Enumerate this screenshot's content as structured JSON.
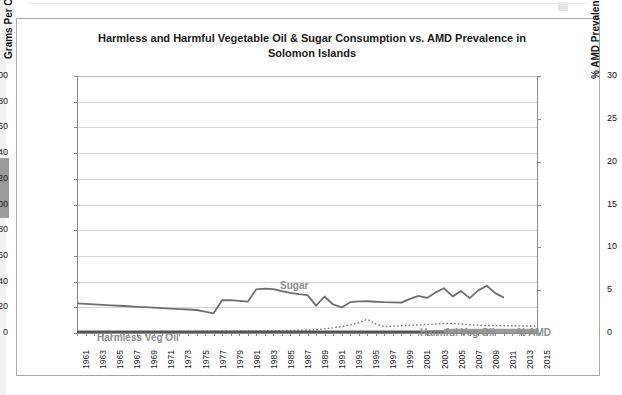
{
  "chart_data": {
    "type": "line",
    "title": "Harmless and Harmful Vegetable Oil & Sugar Consumption vs. AMD Prevalence in Solomon Islands",
    "title_line1": "Harmless and Harmful Vegetable Oil & Sugar Consumption vs. AMD Prevalence in",
    "title_line2": "Solomon Islands",
    "xlabel": "",
    "ylabel": "Grams Per Capita Per Day",
    "ylabel_secondary": "% AMD Prevalence",
    "ylim": [
      0,
      200
    ],
    "ylim_secondary": [
      0,
      30
    ],
    "yticks": [
      0,
      20,
      40,
      60,
      80,
      100,
      120,
      140,
      160,
      180,
      200
    ],
    "yticks_secondary": [
      0,
      5,
      10,
      15,
      20,
      25,
      30
    ],
    "grid": true,
    "legend_position": "inline-annotations",
    "x": [
      1961,
      1962,
      1963,
      1964,
      1965,
      1966,
      1967,
      1968,
      1969,
      1970,
      1971,
      1972,
      1973,
      1974,
      1975,
      1976,
      1977,
      1978,
      1979,
      1980,
      1981,
      1982,
      1983,
      1984,
      1985,
      1986,
      1987,
      1988,
      1989,
      1990,
      1991,
      1992,
      1993,
      1994,
      1995,
      1996,
      1997,
      1998,
      1999,
      2000,
      2001,
      2002,
      2003,
      2004,
      2005,
      2006,
      2007,
      2008,
      2009,
      2010,
      2011,
      2012,
      2013,
      2014,
      2015
    ],
    "xticks": [
      1961,
      1963,
      1965,
      1967,
      1969,
      1971,
      1973,
      1975,
      1977,
      1979,
      1981,
      1983,
      1985,
      1987,
      1989,
      1991,
      1993,
      1995,
      1997,
      1999,
      2001,
      2003,
      2005,
      2007,
      2009,
      2011,
      2013,
      2015
    ],
    "series": [
      {
        "name": "Sugar",
        "axis": "left",
        "color": "#6f6f6f",
        "style": "solid",
        "width": 1.8,
        "values": [
          23,
          22.6,
          22.2,
          21.9,
          21.5,
          21.2,
          20.8,
          20.4,
          20.1,
          19.7,
          19.4,
          19,
          18.6,
          18.3,
          17.9,
          16.6,
          15.3,
          25.5,
          25.6,
          25,
          24.4,
          34,
          34.5,
          34.2,
          32.6,
          31.3,
          30.2,
          29.5,
          21.3,
          28.4,
          22.2,
          19.9,
          24,
          24.6,
          24.7,
          24.3,
          24,
          23.9,
          23.6,
          26.6,
          28.9,
          27.3,
          31.6,
          34.8,
          28.5,
          32.6,
          27.1,
          33.2,
          36.8,
          31,
          27.5,
          null,
          null,
          null,
          null
        ]
      },
      {
        "name": "% AMD",
        "axis": "right",
        "color": "#7a7a7a",
        "style": "dotted",
        "width": 1.4,
        "values": [
          0.12,
          0.12,
          0.13,
          0.13,
          0.14,
          0.14,
          0.15,
          0.15,
          0.16,
          0.16,
          0.17,
          0.17,
          0.18,
          0.18,
          0.19,
          0.2,
          0.2,
          0.21,
          0.22,
          0.23,
          0.24,
          0.25,
          0.26,
          0.27,
          0.28,
          0.3,
          0.32,
          0.35,
          0.4,
          0.48,
          0.6,
          0.75,
          0.95,
          1.2,
          1.6,
          1.05,
          0.75,
          0.8,
          0.85,
          0.9,
          0.95,
          1,
          1.05,
          1.1,
          1.12,
          1.05,
          0.95,
          0.9,
          0.88,
          0.86,
          0.85,
          0.84,
          0.83,
          0.82,
          0.8
        ]
      },
      {
        "name": "Harmless Veg Oil",
        "axis": "left",
        "color": "#555555",
        "style": "solid",
        "width": 3.0,
        "values": [
          0.7,
          0.7,
          0.7,
          0.7,
          0.7,
          0.7,
          0.7,
          0.7,
          0.7,
          0.7,
          0.7,
          0.7,
          0.7,
          0.7,
          0.7,
          0.7,
          0.7,
          0.7,
          0.7,
          0.7,
          0.7,
          0.7,
          0.7,
          0.7,
          0.7,
          0.7,
          0.7,
          0.7,
          0.7,
          0.7,
          0.7,
          0.7,
          0.7,
          0.7,
          0.7,
          0.7,
          0.7,
          0.7,
          0.7,
          0.7,
          0.7,
          0.7,
          0.7,
          0.7,
          0.7,
          0.7,
          0.7,
          0.7,
          0.7,
          0.7,
          0.7,
          0.7,
          0.7,
          0.7,
          0.7
        ]
      },
      {
        "name": "Harmful Veg Oil",
        "axis": "left",
        "color": "#9a9a9a",
        "style": "solid",
        "width": 7.0,
        "values": [
          null,
          null,
          null,
          null,
          null,
          null,
          null,
          null,
          null,
          null,
          null,
          null,
          null,
          null,
          null,
          null,
          null,
          null,
          null,
          null,
          null,
          null,
          null,
          null,
          null,
          null,
          null,
          null,
          null,
          null,
          null,
          null,
          null,
          null,
          null,
          null,
          null,
          null,
          null,
          null,
          null,
          null,
          null,
          0.6,
          0.6,
          0.6,
          0.6,
          0.6,
          0.6,
          0.6,
          0.6,
          0.6,
          0.6,
          0.6,
          0.6
        ]
      }
    ],
    "annotations": [
      {
        "text": "Sugar",
        "x": 1986,
        "y": 44
      },
      {
        "text": "Harmless Veg Oil",
        "x": 1964,
        "y": 7
      },
      {
        "text": "Harmful Veg Oil",
        "x": 2000,
        "y": 10
      },
      {
        "text": "% AMD",
        "x": 2011,
        "y": 10
      }
    ],
    "colors": {
      "sugar": "#6f6f6f",
      "amd": "#7a7a7a",
      "harmless_veg_oil": "#555555",
      "harmful_veg_oil": "#9a9a9a",
      "grid": "#d5d5d5",
      "axis": "#8c8c8c",
      "annotation_text": "#8d8d8d",
      "frame": "#a8a8a8"
    }
  }
}
